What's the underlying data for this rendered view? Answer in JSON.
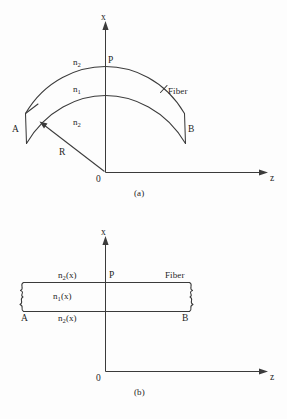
{
  "figure": {
    "background_color": "#fdfdfd",
    "line_color": "#3b3b3b",
    "text_color": "#1e1e1e"
  },
  "panel_a": {
    "caption": "(a)",
    "axis_x_label": "x",
    "axis_z_label": "z",
    "origin_label": "0",
    "point_p_label": "P",
    "end_a_label": "A",
    "end_b_label": "B",
    "fiber_label": "Fiber",
    "radius_label": "R",
    "index_cladding_upper": "n",
    "index_cladding_upper_sub": "2",
    "index_core": "n",
    "index_core_sub": "1",
    "index_cladding_lower": "n",
    "index_cladding_lower_sub": "2"
  },
  "panel_b": {
    "caption": "(b)",
    "axis_x_label": "x",
    "axis_z_label": "z",
    "origin_label": "0",
    "point_p_label": "P",
    "end_a_label": "A",
    "end_b_label": "B",
    "fiber_label": "Fiber",
    "index_cladding_upper": "n",
    "index_cladding_upper_sub": "2",
    "index_cladding_upper_arg": "(x)",
    "index_core": "n",
    "index_core_sub": "1",
    "index_core_arg": "(x)",
    "index_cladding_lower": "n",
    "index_cladding_lower_sub": "2",
    "index_cladding_lower_arg": "(x)"
  }
}
